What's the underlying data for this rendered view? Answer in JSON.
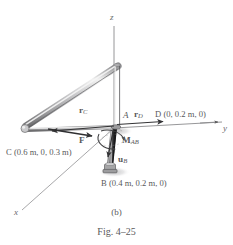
{
  "figure": {
    "caption_sub": "(b)",
    "caption_fig": "Fig. 4–25",
    "axes": {
      "z": "z",
      "y": "y",
      "x": "x"
    },
    "points": {
      "A": "A",
      "B_label": "B",
      "B_coords": "(0.4 m, 0.2 m, 0)",
      "C_label": "C",
      "C_coords": "(0.6 m, 0, 0.3 m)",
      "D_label": "D",
      "D_coords": "(0, 0.2 m, 0)"
    },
    "vectors": {
      "rC": "r",
      "rC_sub": "C",
      "rD": "r",
      "rD_sub": "D",
      "F": "F",
      "MAB": "M",
      "MAB_sub": "AB",
      "uB": "u",
      "uB_sub": "B"
    },
    "colors": {
      "background": "#ffffff",
      "line": "#6b6b6d",
      "member_light": "#d8d8d8",
      "member_mid": "#a9a9ab",
      "member_dark": "#4a4a4c",
      "rod_dark": "#2e2e30",
      "text": "#58585a",
      "shadow": "#cfcfd1",
      "arrow": "#3a3a3c"
    }
  }
}
